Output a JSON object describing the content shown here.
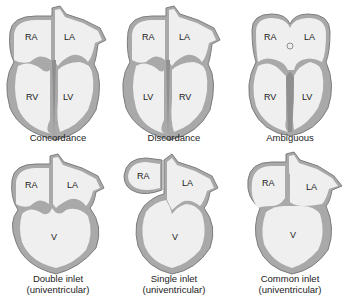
{
  "colors": {
    "chamber_fill": "#efefef",
    "wall": "#a9a9a9",
    "wall_dark": "#8f8f8f",
    "outline": "#7d7d7d",
    "text": "#222222"
  },
  "panels": [
    {
      "id": "concordance",
      "caption_line1": "Concordance",
      "caption_line2": "",
      "labels": {
        "tl": "RA",
        "tr": "LA",
        "bl": "RV",
        "br": "LV"
      }
    },
    {
      "id": "discordance",
      "caption_line1": "Discordance",
      "caption_line2": "",
      "labels": {
        "tl": "RA",
        "tr": "LA",
        "bl": "LV",
        "br": "RV"
      }
    },
    {
      "id": "ambiguous",
      "caption_line1": "Ambiguous",
      "caption_line2": "",
      "labels": {
        "tl": "RA",
        "tr": "LA",
        "bl": "RV",
        "br": "LV"
      }
    },
    {
      "id": "double-inlet",
      "caption_line1": "Double inlet",
      "caption_line2": "(univentricular)",
      "labels": {
        "tl": "RA",
        "tr": "LA",
        "v": "V"
      }
    },
    {
      "id": "single-inlet",
      "caption_line1": "Single inlet",
      "caption_line2": "(univentricular)",
      "labels": {
        "tl": "RA",
        "tr": "LA",
        "v": "V"
      }
    },
    {
      "id": "common-inlet",
      "caption_line1": "Common inlet",
      "caption_line2": "(univentricular)",
      "labels": {
        "tl": "RA",
        "tr": "LA",
        "v": "V"
      }
    }
  ]
}
